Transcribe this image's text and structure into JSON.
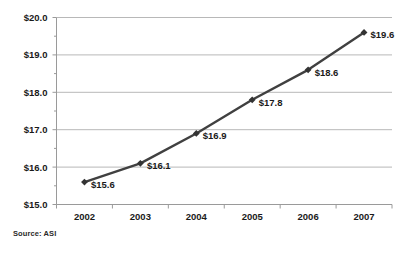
{
  "chart_data": {
    "type": "line",
    "title": "",
    "subtitle": "",
    "xlabel": "",
    "ylabel": "",
    "categories": [
      "2002",
      "2003",
      "2004",
      "2005",
      "2006",
      "2007"
    ],
    "values": [
      15.6,
      16.1,
      16.9,
      17.8,
      18.6,
      19.6
    ],
    "point_labels": [
      "$15.6",
      "$16.1",
      "$16.9",
      "$17.8",
      "$18.6",
      "$19.6"
    ],
    "ylim": [
      15.0,
      20.0
    ],
    "ytick_values": [
      15.0,
      16.0,
      17.0,
      18.0,
      19.0,
      20.0
    ],
    "ytick_labels": [
      "$15.0",
      "$16.0",
      "$17.0",
      "$18.0",
      "$19.0",
      "$20.0"
    ],
    "yminor_tick_values": [
      15.5,
      16.5,
      17.5,
      18.5,
      19.5
    ],
    "grid": true,
    "grid_axis": "y",
    "legend": false,
    "legend_position": "none",
    "series": [
      {
        "name": "",
        "values": [
          15.6,
          16.1,
          16.9,
          17.8,
          18.6,
          19.6
        ],
        "line_color": "#404040",
        "marker": "diamond",
        "marker_color": "#333333"
      }
    ],
    "colors": {
      "line": "#404040",
      "marker": "#333333",
      "grid": "#b8b8b8",
      "axis": "#9a9a9a",
      "text": "#1a1a1a",
      "background": "#ffffff"
    }
  },
  "footnote": {
    "source_text": "Source: ASI"
  }
}
